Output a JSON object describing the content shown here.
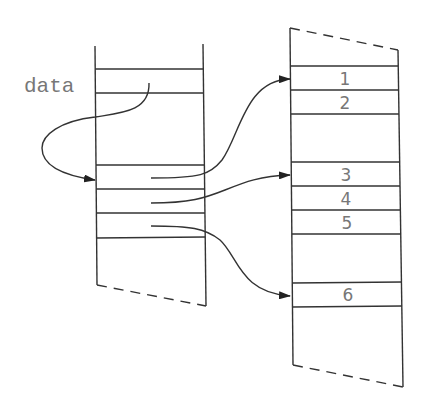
{
  "labels": {
    "data_label": "data",
    "slots": [
      "1",
      "2",
      "3",
      "4",
      "5",
      "6"
    ]
  },
  "colors": {
    "line": "#333333",
    "text": "#777777",
    "background": "#ffffff"
  }
}
